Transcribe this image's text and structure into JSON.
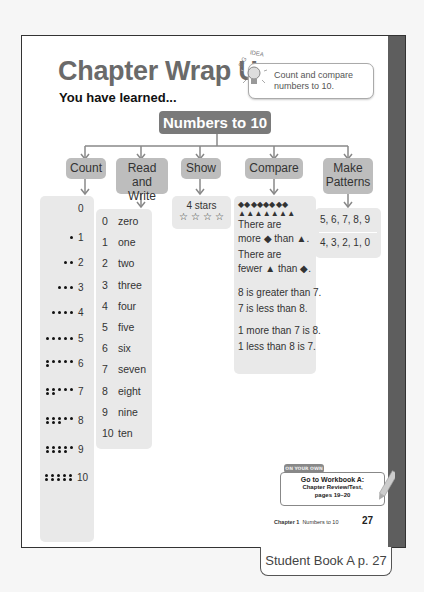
{
  "page": {
    "title": "Chapter Wrap Up",
    "subtitle": "You have learned...",
    "big_idea": {
      "label": "BIG IDEA",
      "text_line1": "Count and compare",
      "text_line2": "numbers to 10."
    },
    "root_topic": "Numbers to 10",
    "categories": [
      {
        "label_line1": "Count",
        "label_line2": ""
      },
      {
        "label_line1": "Read and",
        "label_line2": "Write"
      },
      {
        "label_line1": "Show",
        "label_line2": ""
      },
      {
        "label_line1": "Compare",
        "label_line2": ""
      },
      {
        "label_line1": "Make",
        "label_line2": "Patterns"
      }
    ],
    "count": [
      {
        "dots": 0,
        "number": "0"
      },
      {
        "dots": 1,
        "number": "1"
      },
      {
        "dots": 2,
        "number": "2"
      },
      {
        "dots": 3,
        "number": "3"
      },
      {
        "dots": 4,
        "number": "4"
      },
      {
        "dots": 5,
        "number": "5"
      },
      {
        "dots": 6,
        "number": "6"
      },
      {
        "dots": 7,
        "number": "7"
      },
      {
        "dots": 8,
        "number": "8"
      },
      {
        "dots": 9,
        "number": "9"
      },
      {
        "dots": 10,
        "number": "10"
      }
    ],
    "read_write": [
      {
        "num": "0",
        "word": "zero"
      },
      {
        "num": "1",
        "word": "one"
      },
      {
        "num": "2",
        "word": "two"
      },
      {
        "num": "3",
        "word": "three"
      },
      {
        "num": "4",
        "word": "four"
      },
      {
        "num": "5",
        "word": "five"
      },
      {
        "num": "6",
        "word": "six"
      },
      {
        "num": "7",
        "word": "seven"
      },
      {
        "num": "8",
        "word": "eight"
      },
      {
        "num": "9",
        "word": "nine"
      },
      {
        "num": "10",
        "word": "ten"
      }
    ],
    "show": {
      "label": "4 stars",
      "stars": "☆ ☆ ☆ ☆"
    },
    "compare": {
      "diamonds": "◆◆◆◆◆◆◆◆",
      "triangles": "▲▲▲▲▲▲▲",
      "lines_a": [
        "There are",
        "more ◆ than ▲."
      ],
      "lines_b": [
        "There are",
        "fewer ▲ than ◆."
      ],
      "lines_c": [
        "8 is greater than 7.",
        "7 is less than 8."
      ],
      "lines_d": [
        "1 more than 7 is 8.",
        "1 less than 8 is 7."
      ]
    },
    "patterns": [
      "5, 6, 7, 8, 9",
      "4, 3, 2, 1, 0"
    ],
    "on_your_own": {
      "tag": "ON YOUR OWN",
      "line1": "Go to Workbook A:",
      "line2": "Chapter Review/Test,",
      "line3": "pages 19–20"
    },
    "footer": {
      "chapter": "Chapter 1",
      "chapter_title": "Numbers to 10",
      "page_number": "27"
    }
  },
  "tab_label": "Student Book A  p. 27"
}
